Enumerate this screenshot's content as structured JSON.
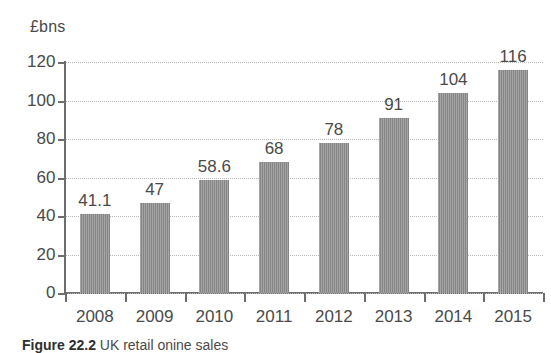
{
  "chart_data": {
    "type": "bar",
    "title": "",
    "subtitle": "",
    "xlabel": "",
    "ylabel": "£bns",
    "unit_label": "£bns",
    "categories": [
      "2008",
      "2009",
      "2010",
      "2011",
      "2012",
      "2013",
      "2014",
      "2015"
    ],
    "values": [
      41.1,
      47,
      58.6,
      68,
      78,
      91,
      104,
      116
    ],
    "value_labels": [
      "41.1",
      "47",
      "58.6",
      "68",
      "78",
      "91",
      "104",
      "116"
    ],
    "series": [
      {
        "name": "",
        "values": [
          41.1,
          47,
          58.6,
          68,
          78,
          91,
          104,
          116
        ]
      }
    ],
    "ylim": [
      0,
      120
    ],
    "ytick_values": [
      0,
      20,
      40,
      60,
      80,
      100,
      120
    ],
    "ytick_labels": [
      "0",
      "20",
      "40",
      "60",
      "80",
      "100",
      "120"
    ],
    "grid": true,
    "grid_axis": "y",
    "legend": false,
    "legend_position": "none",
    "bar_color": "#8c8c8c",
    "axis_color": "#6d6d6d",
    "gridline_color": "#b9b9b9",
    "text_color": "#4a4a4a",
    "background": "#ffffff",
    "annotations": [
      "Data value printed above each bar"
    ]
  },
  "caption": {
    "figure_number": "Figure 22.2",
    "text": "UK retail onine sales"
  }
}
